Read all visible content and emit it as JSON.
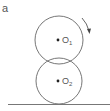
{
  "figure": {
    "panel_label": "a",
    "circles": [
      {
        "id": "top",
        "center_label": "O",
        "subscript": "1",
        "cx": 59,
        "cy": 40,
        "r": 24
      },
      {
        "id": "bottom",
        "center_label": "O",
        "subscript": "2",
        "cx": 59,
        "cy": 81,
        "r": 23
      }
    ],
    "rotation_arrow": {
      "direction": "clockwise",
      "on": "top"
    },
    "ground": {
      "y": 104,
      "x1": 8,
      "x2": 110
    },
    "colors": {
      "stroke": "#666666",
      "dot": "#222222",
      "text": "#555555"
    }
  }
}
